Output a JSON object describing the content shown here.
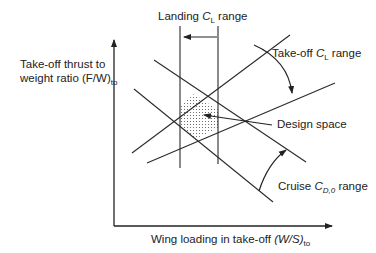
{
  "diagram": {
    "y_axis_label": {
      "line1": "Take-off thrust to",
      "line2_prefix": "weight ratio (F/W)",
      "line2_sub": "to"
    },
    "x_axis_label": {
      "prefix": "Wing loading in take-off ",
      "italic": "(W/S)",
      "sub": "to"
    },
    "annotations": {
      "landing": {
        "prefix": "Landing ",
        "italic": "C",
        "sub": "L",
        "suffix": " range"
      },
      "takeoff": {
        "prefix": "Take-off ",
        "italic": "C",
        "sub": "L",
        "suffix": " range"
      },
      "design_space": "Design space",
      "cruise": {
        "prefix": "Cruise ",
        "italic": "C",
        "sub": "D,0",
        "suffix": " range"
      }
    },
    "constraint_lines": [
      {
        "name": "landing-limit-left",
        "kind": "vertical"
      },
      {
        "name": "landing-limit-right",
        "kind": "vertical"
      },
      {
        "name": "takeoff-limit-upper",
        "kind": "rising"
      },
      {
        "name": "takeoff-limit-lower",
        "kind": "rising"
      },
      {
        "name": "cruise-limit-upper",
        "kind": "falling"
      },
      {
        "name": "cruise-limit-lower",
        "kind": "falling"
      }
    ],
    "colors": {
      "line": "#2a2a2a",
      "dots": "#555555",
      "background": "#ffffff"
    }
  }
}
